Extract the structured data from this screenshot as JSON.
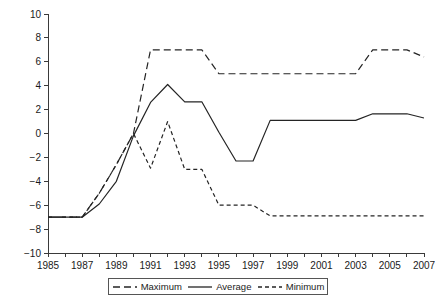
{
  "chart_data": {
    "type": "line",
    "title": "",
    "subtitle": "",
    "xlabel": "",
    "ylabel": "",
    "xlim": [
      1985,
      2007
    ],
    "ylim": [
      -10,
      10
    ],
    "grid": false,
    "legend_position": "bottom",
    "x": [
      1985,
      1986,
      1987,
      1988,
      1989,
      1990,
      1991,
      1992,
      1993,
      1994,
      1995,
      1996,
      1997,
      1998,
      1999,
      2000,
      2001,
      2002,
      2003,
      2004,
      2005,
      2006,
      2007
    ],
    "xtick_labels": [
      "1985",
      "1987",
      "1989",
      "1991",
      "1993",
      "1995",
      "1997",
      "1999",
      "2001",
      "2003",
      "2005",
      "2007"
    ],
    "xtick_values": [
      1985,
      1987,
      1989,
      1991,
      1993,
      1995,
      1997,
      1999,
      2001,
      2003,
      2005,
      2007
    ],
    "ytick_labels": [
      "10",
      "8",
      "6",
      "4",
      "2",
      "0",
      "−2",
      "−4",
      "−6",
      "−8",
      "−10"
    ],
    "ytick_values": [
      10,
      8,
      6,
      4,
      2,
      0,
      -2,
      -4,
      -6,
      -8,
      -10
    ],
    "series": [
      {
        "name": "Maximum",
        "style": "long-dashed",
        "color": "#242424",
        "values": [
          -7.0,
          -7.0,
          -7.0,
          -5.0,
          -2.6,
          0.0,
          7.0,
          7.0,
          7.0,
          7.0,
          5.0,
          5.0,
          5.0,
          5.0,
          5.0,
          5.0,
          5.0,
          5.0,
          5.0,
          7.0,
          7.0,
          7.0,
          6.4
        ]
      },
      {
        "name": "Average",
        "style": "solid",
        "color": "#242424",
        "values": [
          -7.0,
          -7.0,
          -7.0,
          -5.9,
          -4.0,
          -0.2,
          2.6,
          4.1,
          2.65,
          2.65,
          0.1,
          -2.3,
          -2.3,
          1.1,
          1.1,
          1.1,
          1.1,
          1.1,
          1.1,
          1.65,
          1.65,
          1.65,
          1.3
        ]
      },
      {
        "name": "Minimum",
        "style": "short-dashed",
        "color": "#242424",
        "values": [
          -7.0,
          -7.0,
          -7.0,
          -5.0,
          -2.6,
          0.0,
          -2.9,
          1.0,
          -3.0,
          -3.0,
          -6.0,
          -6.0,
          -6.0,
          -6.9,
          -6.9,
          -6.9,
          -6.9,
          -6.9,
          -6.9,
          -6.9,
          -6.9,
          -6.9,
          -6.9
        ]
      }
    ]
  },
  "legend": {
    "items": [
      {
        "label": "Maximum",
        "style": "long-dashed"
      },
      {
        "label": "Average",
        "style": "solid"
      },
      {
        "label": "Minimum",
        "style": "short-dashed"
      }
    ]
  }
}
